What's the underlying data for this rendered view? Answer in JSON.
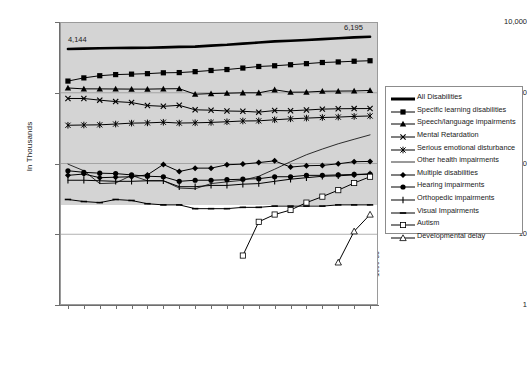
{
  "chart_data": {
    "type": "line",
    "title": "",
    "subtitle": "",
    "xlabel": "",
    "ylabel": "In Thousands",
    "yscale": "log",
    "ylim": [
      1,
      10000
    ],
    "ytick_labels": [
      "10,000",
      "1,000",
      "100",
      "10",
      "1"
    ],
    "ytick_values": [
      10000,
      1000,
      100,
      10,
      1
    ],
    "grid": true,
    "legend_position": "right",
    "categories": [
      "1980-81",
      "1981-82",
      "1982-83",
      "1983-84",
      "1984-85",
      "1985-86",
      "1986-87",
      "1987-88",
      "1988-89",
      "1989-90",
      "1990-91",
      "1991-92",
      "1992-93",
      "1993-94",
      "1994-95",
      "1995-96",
      "1996-97",
      "1997-98",
      "1998-99",
      "1999-00"
    ],
    "annotations": [
      {
        "text": "4,144",
        "series": "All Disabilities",
        "category": "1980-81",
        "value": 4144
      },
      {
        "text": "6,195",
        "series": "All Disabilities",
        "category": "1999-00",
        "value": 6195
      }
    ],
    "series": [
      {
        "name": "All Disabilities",
        "marker": "none",
        "line": "thick",
        "values": [
          4144,
          4198,
          4255,
          4298,
          4315,
          4317,
          4374,
          4447,
          4494,
          4641,
          4762,
          4949,
          5125,
          5318,
          5440,
          5573,
          5729,
          5903,
          6055,
          6195
        ]
      },
      {
        "name": "Specific learning disabilities",
        "marker": "filled-square",
        "line": "normal",
        "values": [
          1462,
          1622,
          1741,
          1806,
          1832,
          1862,
          1914,
          1928,
          1987,
          2064,
          2129,
          2234,
          2351,
          2407,
          2489,
          2579,
          2676,
          2726,
          2789,
          2834
        ]
      },
      {
        "name": "Speech/language impairments",
        "marker": "filled-triangle",
        "line": "normal",
        "values": [
          1168,
          1135,
          1134,
          1130,
          1126,
          1125,
          1136,
          1141,
          953,
          973,
          985,
          998,
          998,
          1101,
          1018,
          1022,
          1050,
          1056,
          1060,
          1078
        ]
      },
      {
        "name": "Mental Retardation",
        "marker": "x-cross",
        "line": "normal",
        "values": [
          830,
          829,
          786,
          750,
          727,
          660,
          643,
          664,
          574,
          567,
          552,
          547,
          532,
          560,
          556,
          570,
          587,
          594,
          597,
          598
        ]
      },
      {
        "name": "Serious emotional disturbance",
        "marker": "asterisk",
        "line": "normal",
        "values": [
          347,
          350,
          352,
          361,
          372,
          375,
          383,
          373,
          376,
          381,
          389,
          399,
          401,
          415,
          428,
          438,
          447,
          453,
          463,
          470
        ]
      },
      {
        "name": "Other health impairments",
        "marker": "none",
        "line": "thin",
        "values": [
          98,
          79,
          52,
          53,
          68,
          57,
          57,
          45,
          44,
          52,
          55,
          58,
          66,
          83,
          106,
          133,
          160,
          190,
          220,
          254
        ]
      },
      {
        "name": "Multiple disabilities",
        "marker": "filled-diamond",
        "line": "normal",
        "values": [
          68,
          71,
          63,
          64,
          65,
          69,
          97,
          77,
          86,
          86,
          96,
          98,
          103,
          109,
          89,
          93,
          94,
          99,
          106,
          107
        ]
      },
      {
        "name": "Hearing impairments",
        "marker": "filled-circle",
        "line": "normal",
        "values": [
          79,
          75,
          73,
          72,
          69,
          66,
          65,
          56,
          58,
          58,
          59,
          60,
          61,
          65,
          65,
          68,
          68,
          69,
          70,
          71
        ]
      },
      {
        "name": "Orthopedic impairments",
        "marker": "plus",
        "line": "normal",
        "values": [
          58,
          58,
          57,
          56,
          56,
          57,
          57,
          47,
          47,
          49,
          49,
          51,
          52,
          56,
          60,
          63,
          66,
          67,
          69,
          71
        ]
      },
      {
        "name": "Visual Impairments",
        "marker": "dash",
        "line": "normal",
        "values": [
          31,
          29,
          28,
          31,
          30,
          27,
          26,
          26,
          23,
          23,
          23,
          24,
          24,
          25,
          25,
          25,
          25,
          26,
          26,
          26
        ]
      },
      {
        "name": "Autism",
        "marker": "open-square",
        "line": "normal",
        "values": [
          null,
          null,
          null,
          null,
          null,
          null,
          null,
          null,
          null,
          null,
          null,
          5,
          15,
          19,
          22,
          28,
          34,
          42,
          53,
          65
        ]
      },
      {
        "name": "Developmental delay",
        "marker": "open-triangle",
        "line": "normal",
        "values": [
          null,
          null,
          null,
          null,
          null,
          null,
          null,
          null,
          null,
          null,
          null,
          null,
          null,
          null,
          null,
          null,
          null,
          4,
          11,
          19
        ]
      }
    ]
  }
}
